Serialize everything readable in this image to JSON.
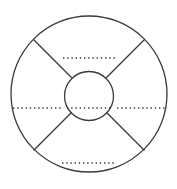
{
  "diagram": {
    "background_color": "#ffffff",
    "stroke_color": "#3a3a3a",
    "line_stroke_width": 1.3,
    "dot_stroke_width": 1.5,
    "dot_dash_pattern": "1.4 2.8",
    "canvas": {
      "width": 177,
      "height": 189
    },
    "outer_circle": {
      "name": "outer-circle",
      "cx": 89,
      "cy": 94,
      "r": 78
    },
    "inner_circle": {
      "name": "inner-circle",
      "cx": 89,
      "cy": 96,
      "r": 24.5
    },
    "spokes": [
      {
        "name": "spoke-top-left",
        "x1": 33.5,
        "y1": 39.5,
        "x2": 71.7,
        "y2": 77.7
      },
      {
        "name": "spoke-top-right",
        "x1": 144.5,
        "y1": 39.5,
        "x2": 106.3,
        "y2": 77.7
      },
      {
        "name": "spoke-bottom-left",
        "x1": 33.5,
        "y1": 150.5,
        "x2": 71.7,
        "y2": 112.3
      },
      {
        "name": "spoke-bottom-right",
        "x1": 144.5,
        "y1": 150.5,
        "x2": 106.3,
        "y2": 112.3
      }
    ],
    "dotted_lines": [
      {
        "name": "dotted-line-top-quadrant",
        "x1": 63,
        "y1": 58,
        "x2": 117,
        "y2": 58
      },
      {
        "name": "dotted-line-left-quadrant",
        "x1": 13,
        "y1": 108,
        "x2": 62,
        "y2": 108
      },
      {
        "name": "dotted-line-center-circle",
        "x1": 67,
        "y1": 108,
        "x2": 111,
        "y2": 108
      },
      {
        "name": "dotted-line-right-quadrant",
        "x1": 117,
        "y1": 108,
        "x2": 165,
        "y2": 108
      },
      {
        "name": "dotted-line-bottom-quadrant",
        "x1": 62,
        "y1": 163,
        "x2": 115,
        "y2": 163
      }
    ]
  }
}
